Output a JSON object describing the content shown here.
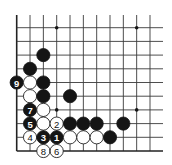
{
  "diagram": {
    "type": "go-board-corner",
    "grid": {
      "origin_x": 16.7,
      "origin_y": 27.7,
      "spacing_x": 13.33,
      "spacing_y": 13.7,
      "columns": 11,
      "rows": 10,
      "left_edge": true,
      "bottom_edge": true,
      "top_edge": false,
      "right_edge": false,
      "extend_top_to": 15,
      "extend_right_to": 163
    },
    "colors": {
      "black_stone": "#151515",
      "white_stone": "#ffffff",
      "line": "#3a3a3a"
    },
    "star_points": [
      {
        "col": 3,
        "row": 0
      },
      {
        "col": 9,
        "row": 0
      },
      {
        "col": 3,
        "row": 6
      },
      {
        "col": 9,
        "row": 6
      }
    ],
    "stones": [
      {
        "color": "black",
        "col": 2,
        "row": 2,
        "label": ""
      },
      {
        "color": "black",
        "col": 1,
        "row": 3,
        "label": ""
      },
      {
        "color": "black",
        "col": 0,
        "row": 4,
        "label": "9"
      },
      {
        "color": "white",
        "col": 1,
        "row": 4,
        "label": ""
      },
      {
        "color": "black",
        "col": 2,
        "row": 4,
        "label": ""
      },
      {
        "color": "white",
        "col": 1,
        "row": 5,
        "label": ""
      },
      {
        "color": "black",
        "col": 2,
        "row": 5,
        "label": ""
      },
      {
        "color": "black",
        "col": 4,
        "row": 5,
        "label": ""
      },
      {
        "color": "black",
        "col": 1,
        "row": 6,
        "label": "7"
      },
      {
        "color": "white",
        "col": 2,
        "row": 6,
        "label": ""
      },
      {
        "color": "black",
        "col": 1,
        "row": 7,
        "label": "5"
      },
      {
        "color": "white",
        "col": 2,
        "row": 7,
        "label": ""
      },
      {
        "color": "white",
        "col": 3,
        "row": 7,
        "label": "2"
      },
      {
        "color": "black",
        "col": 4,
        "row": 7,
        "label": ""
      },
      {
        "color": "black",
        "col": 5,
        "row": 7,
        "label": ""
      },
      {
        "color": "black",
        "col": 6,
        "row": 7,
        "label": ""
      },
      {
        "color": "black",
        "col": 8,
        "row": 7,
        "label": ""
      },
      {
        "color": "white",
        "col": 1,
        "row": 8,
        "label": "4"
      },
      {
        "color": "black",
        "col": 2,
        "row": 8,
        "label": "3"
      },
      {
        "color": "black",
        "col": 3,
        "row": 8,
        "label": "1"
      },
      {
        "color": "white",
        "col": 4,
        "row": 8,
        "label": ""
      },
      {
        "color": "white",
        "col": 5,
        "row": 8,
        "label": ""
      },
      {
        "color": "white",
        "col": 6,
        "row": 8,
        "label": ""
      },
      {
        "color": "black",
        "col": 7,
        "row": 8,
        "label": ""
      },
      {
        "color": "white",
        "col": 2,
        "row": 9,
        "label": "8"
      },
      {
        "color": "white",
        "col": 3,
        "row": 9,
        "label": "6"
      }
    ],
    "move_sequence": [
      {
        "move": "1",
        "color": "black",
        "col": 3,
        "row": 8
      },
      {
        "move": "2",
        "color": "white",
        "col": 3,
        "row": 7
      },
      {
        "move": "3",
        "color": "black",
        "col": 2,
        "row": 8
      },
      {
        "move": "4",
        "color": "white",
        "col": 1,
        "row": 8
      },
      {
        "move": "5",
        "color": "black",
        "col": 1,
        "row": 7
      },
      {
        "move": "6",
        "color": "white",
        "col": 3,
        "row": 9
      },
      {
        "move": "7",
        "color": "black",
        "col": 1,
        "row": 6
      },
      {
        "move": "8",
        "color": "white",
        "col": 2,
        "row": 9
      },
      {
        "move": "9",
        "color": "black",
        "col": 0,
        "row": 4
      }
    ],
    "stone_radius": 6.6,
    "star_radius": 1.8
  }
}
